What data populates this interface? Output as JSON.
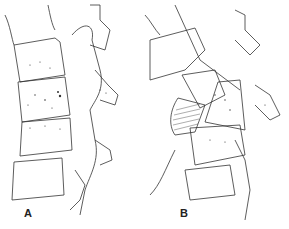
{
  "figure": {
    "panels": [
      {
        "label": "A",
        "description": "Lateral view of spinal vertebrae with stippled vertebral body lesion"
      },
      {
        "label": "B",
        "description": "Lateral view of spinal vertebrae with collapsed/wedged vertebral body and hatched paravertebral mass"
      }
    ],
    "colors": {
      "line": "#333333",
      "background": "#ffffff"
    }
  }
}
